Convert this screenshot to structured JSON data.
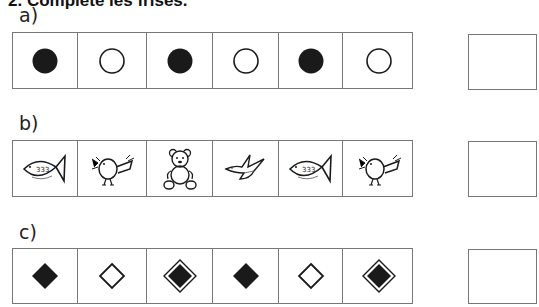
{
  "exercise": {
    "title": "2. Complète les frises."
  },
  "rows": [
    {
      "label": "a)",
      "items": [
        "filled-circle",
        "empty-circle",
        "filled-circle",
        "empty-circle",
        "filled-circle",
        "empty-circle"
      ],
      "answer": ""
    },
    {
      "label": "b)",
      "items": [
        "fish",
        "bird",
        "teddy-bear",
        "swallow",
        "fish",
        "bird"
      ],
      "answer": ""
    },
    {
      "label": "c)",
      "items": [
        "filled-diamond",
        "empty-diamond",
        "framed-filled-diamond",
        "filled-diamond",
        "empty-diamond",
        "framed-filled-diamond"
      ],
      "answer": ""
    }
  ],
  "colors": {
    "ink": "#1a1a1a",
    "border": "#777777"
  }
}
